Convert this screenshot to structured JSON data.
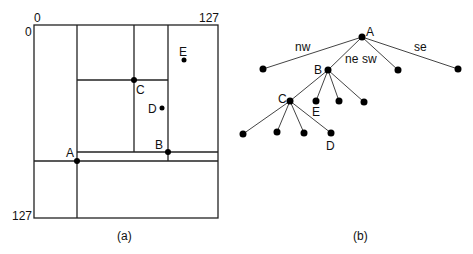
{
  "panel_a": {
    "caption": "(a)",
    "axis": {
      "x_start": "0",
      "x_end": "127",
      "y_start": "0",
      "y_end": "127"
    },
    "points": [
      {
        "label": "A",
        "x": 77,
        "y": 161
      },
      {
        "label": "B",
        "x": 168,
        "y": 152
      },
      {
        "label": "C",
        "x": 134,
        "y": 80
      },
      {
        "label": "D",
        "x": 162,
        "y": 108
      },
      {
        "label": "E",
        "x": 184,
        "y": 60
      }
    ]
  },
  "panel_b": {
    "caption": "(b)",
    "edge_labels": {
      "nw": "nw",
      "ne": "ne",
      "sw": "sw",
      "se": "se"
    },
    "node_labels": {
      "A": "A",
      "B": "B",
      "C": "C",
      "D": "D",
      "E": "E"
    }
  }
}
